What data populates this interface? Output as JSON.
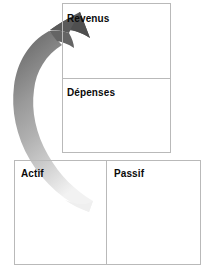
{
  "diagram": {
    "background_color": "#ffffff",
    "border_color": "#b9b9b9",
    "text_color": "#0a0a0a"
  },
  "income_statement": {
    "name": "income-expense-box",
    "cells": [
      {
        "id": "revenus",
        "label": "Revenus"
      },
      {
        "id": "depenses",
        "label": "Dépenses"
      }
    ]
  },
  "balance_sheet": {
    "name": "assets-liabilities-box",
    "cells": [
      {
        "id": "actif",
        "label": "Actif"
      },
      {
        "id": "passif",
        "label": "Passif"
      }
    ]
  },
  "arrow": {
    "name": "curved-flow-arrow",
    "description": "curved-arrow-icon",
    "direction": "from-assets-to-income",
    "head_color": "#4a4a4a",
    "tail_color": "#e8e8e8",
    "gradient_mid_color": "#9a9a9a"
  }
}
